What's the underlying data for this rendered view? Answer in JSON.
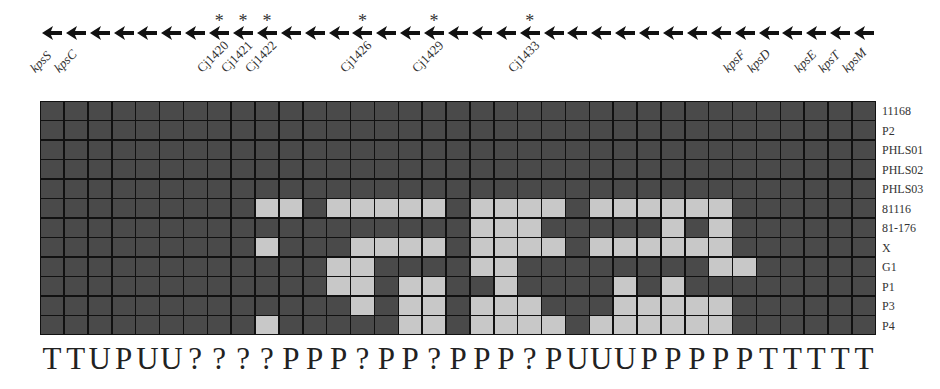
{
  "figure": {
    "columns": 35,
    "arrow_direction": "left",
    "gene_labels": [
      {
        "col": 0,
        "text": "kpsS",
        "italic": true
      },
      {
        "col": 1,
        "text": "kpsC",
        "italic": true
      },
      {
        "col": 7,
        "text": "Cj1420",
        "italic": false
      },
      {
        "col": 8,
        "text": "Cj1421",
        "italic": false
      },
      {
        "col": 9,
        "text": "Cj1422",
        "italic": false
      },
      {
        "col": 13,
        "text": "Cj1426",
        "italic": false
      },
      {
        "col": 16,
        "text": "Cj1429",
        "italic": false
      },
      {
        "col": 20,
        "text": "Cj1433",
        "italic": false
      },
      {
        "col": 29,
        "text": "kpsF",
        "italic": true
      },
      {
        "col": 30,
        "text": "kpsD",
        "italic": true
      },
      {
        "col": 32,
        "text": "kpsE",
        "italic": true
      },
      {
        "col": 33,
        "text": "kpsT",
        "italic": true
      },
      {
        "col": 34,
        "text": "kpsM",
        "italic": true
      }
    ],
    "asterisk_columns": [
      7,
      8,
      9,
      13,
      16,
      20
    ],
    "asterisk_symbol": "*",
    "strains": [
      "11168",
      "P2",
      "PHLS01",
      "PHLS02",
      "PHLS03",
      "81116",
      "81-176",
      "X",
      "G1",
      "P1",
      "P3",
      "P4"
    ],
    "colors": {
      "absent_dark": "#4a4a4a",
      "present_light": "#c8c8c8",
      "grid_line": "#111111"
    },
    "matrix": [
      "00000000000000000000000000000000000",
      "00000000000000000000000000000000000",
      "00000000000000000000000000000000000",
      "00000000000000000000000000000000000",
      "00000000000000000000000000000000000",
      "00000000011011111011110111111000000",
      "00000000000000000011100000101000000",
      "00000000010001111011110111111000000",
      "00000000000011000011000000001100000",
      "00000000000011011001000010100000000",
      "00000000000001011011100011111000000",
      "00000000010000011011110111111000000"
    ],
    "class_letters": [
      "T",
      "T",
      "U",
      "P",
      "U",
      "U",
      "?",
      "?",
      "?",
      "?",
      "P",
      "P",
      "P",
      "?",
      "P",
      "P",
      "?",
      "P",
      "P",
      "P",
      "?",
      "P",
      "U",
      "U",
      "U",
      "P",
      "P",
      "P",
      "P",
      "P",
      "T",
      "T",
      "T",
      "T",
      "T"
    ]
  }
}
